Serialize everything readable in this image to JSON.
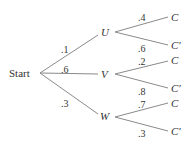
{
  "diagram": {
    "type": "probability-tree",
    "root": {
      "label": "Start"
    },
    "first_level": [
      {
        "label": "U",
        "prob": ".1",
        "children": [
          {
            "label": "C",
            "prob": ".4"
          },
          {
            "label": "C′",
            "prob": ".6"
          }
        ]
      },
      {
        "label": "V",
        "prob": ".6",
        "children": [
          {
            "label": "C",
            "prob": ".2"
          },
          {
            "label": "C′",
            "prob": ".8"
          }
        ]
      },
      {
        "label": "W",
        "prob": ".3",
        "children": [
          {
            "label": "C",
            "prob": ".7"
          },
          {
            "label": "C′",
            "prob": ".3"
          }
        ]
      }
    ],
    "line_color": "#888888",
    "text_color": "#333333"
  }
}
